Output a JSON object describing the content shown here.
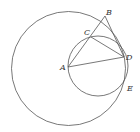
{
  "diagram": {
    "type": "geometry",
    "stroke_color": "#555555",
    "large_circle": {
      "cx": 68.5,
      "cy": 68.5,
      "r": 57
    },
    "small_circle": {
      "cx": 98,
      "cy": 66,
      "r": 30
    },
    "points": {
      "A": {
        "label": "A",
        "x": 68,
        "y": 67
      },
      "B": {
        "label": "B",
        "x": 105,
        "y": 16
      },
      "C": {
        "label": "C",
        "x": 91,
        "y": 37
      },
      "D": {
        "label": "D",
        "x": 124,
        "y": 57
      },
      "E": {
        "label": "E",
        "x": 125,
        "y": 83
      }
    },
    "segments": [
      [
        "A",
        "B"
      ],
      [
        "A",
        "D"
      ],
      [
        "C",
        "D"
      ],
      [
        "B",
        "D"
      ]
    ]
  }
}
